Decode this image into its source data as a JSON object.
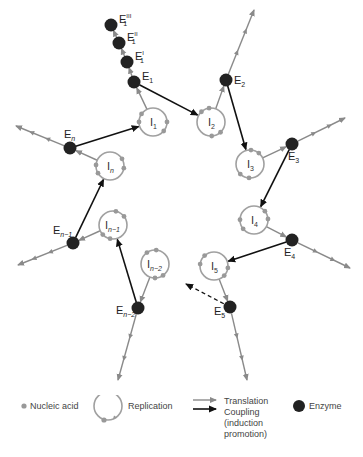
{
  "diagram": {
    "colors": {
      "translation": "#8a8a8a",
      "coupling": "#111111",
      "enzyme": "#222222",
      "nucleic_acid": "#999999",
      "replication_ring": "#a0a0a0"
    },
    "intermediates": [
      {
        "id": "I1",
        "base": "I",
        "sub": "1"
      },
      {
        "id": "I2",
        "base": "I",
        "sub": "2"
      },
      {
        "id": "I3",
        "base": "I",
        "sub": "3"
      },
      {
        "id": "I4",
        "base": "I",
        "sub": "4"
      },
      {
        "id": "I5",
        "base": "I",
        "sub": "5"
      },
      {
        "id": "In-2",
        "base": "I",
        "sub": "n−2"
      },
      {
        "id": "In-1",
        "base": "I",
        "sub": "n−1"
      },
      {
        "id": "In",
        "base": "I",
        "sub": "n"
      }
    ],
    "enzymes": [
      {
        "id": "E1",
        "base": "E",
        "sub": "1",
        "sup": ""
      },
      {
        "id": "E1'",
        "base": "E",
        "sub": "1",
        "sup": "I"
      },
      {
        "id": "E1''",
        "base": "E",
        "sub": "1",
        "sup": "II"
      },
      {
        "id": "E1'''",
        "base": "E",
        "sub": "1",
        "sup": "III"
      },
      {
        "id": "E2",
        "base": "E",
        "sub": "2",
        "sup": ""
      },
      {
        "id": "E3",
        "base": "E",
        "sub": "3",
        "sup": ""
      },
      {
        "id": "E4",
        "base": "E",
        "sub": "4",
        "sup": ""
      },
      {
        "id": "E5",
        "base": "E",
        "sub": "5",
        "sup": ""
      },
      {
        "id": "En-2",
        "base": "E",
        "sub": "n−2",
        "sup": ""
      },
      {
        "id": "En-1",
        "base": "E",
        "sub": "n−1",
        "sup": ""
      },
      {
        "id": "En",
        "base": "E",
        "sub": "n",
        "sup": ""
      }
    ],
    "coupling_edges": [
      {
        "from": "E1",
        "to": "I2",
        "style": "solid"
      },
      {
        "from": "E2",
        "to": "I3",
        "style": "solid"
      },
      {
        "from": "E3",
        "to": "I4",
        "style": "solid"
      },
      {
        "from": "E4",
        "to": "I5",
        "style": "solid"
      },
      {
        "from": "E5",
        "to": "next",
        "style": "dashed"
      },
      {
        "from": "En-2",
        "to": "In-1",
        "style": "solid"
      },
      {
        "from": "En-1",
        "to": "In",
        "style": "solid"
      },
      {
        "from": "En",
        "to": "I1",
        "style": "solid"
      }
    ],
    "translation_edges": [
      {
        "from": "I1",
        "to": "E1"
      },
      {
        "from": "I2",
        "to": "E2"
      },
      {
        "from": "I3",
        "to": "E3"
      },
      {
        "from": "I4",
        "to": "E4"
      },
      {
        "from": "I5",
        "to": "E5"
      },
      {
        "from": "In-2",
        "to": "En-2"
      },
      {
        "from": "In-1",
        "to": "En-1"
      },
      {
        "from": "In",
        "to": "En"
      }
    ]
  },
  "legend": {
    "nucleic_acid": "Nucleic acid",
    "replication": "Replication",
    "translation": "Translation",
    "coupling_line1": "Coupling",
    "coupling_line2": "(induction",
    "coupling_line3": "promotion)",
    "enzyme": "Enzyme"
  }
}
